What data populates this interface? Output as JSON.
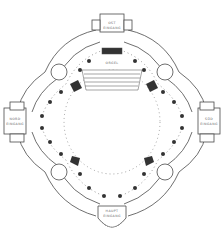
{
  "diagram": {
    "type": "architectural-floor-plan",
    "labels": {
      "top": [
        "OST",
        "EINGANG"
      ],
      "center": "ORGEL",
      "left": [
        "NORD",
        "EINGANG"
      ],
      "right": [
        "SÜD",
        "EINGANG"
      ],
      "bottom": [
        "HAUPT",
        "EINGANG"
      ]
    },
    "colors": {
      "line": "#4a4a4a",
      "fill_dark": "#333333",
      "background": "#ffffff"
    }
  }
}
